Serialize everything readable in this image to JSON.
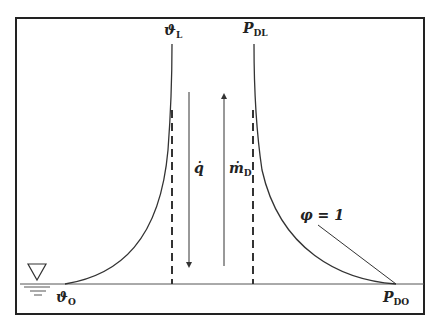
{
  "diagram": {
    "labels": {
      "theta_L": {
        "main": "ϑ",
        "sub": "L"
      },
      "P_DL": {
        "main": "P",
        "sub": "DL"
      },
      "q_dot": {
        "main": "q̇",
        "sub": ""
      },
      "m_dot_D": {
        "main": "ṁ",
        "sub": "D"
      },
      "phi": {
        "main": "φ = 1",
        "sub": ""
      },
      "theta_O": {
        "main": "ϑ",
        "sub": "O"
      },
      "P_DO": {
        "main": "P",
        "sub": "DO"
      }
    },
    "colors": {
      "line": "#333333",
      "frame": "#222222",
      "background": "#ffffff"
    }
  }
}
